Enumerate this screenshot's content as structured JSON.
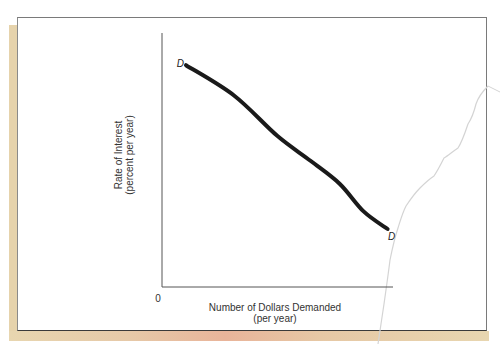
{
  "chart_data": {
    "type": "line",
    "title": "",
    "xlabel": "Number of Dollars Demanded",
    "xlabel_sub": "(per year)",
    "ylabel": "Rate of Interest",
    "ylabel_sub": "(percent per year)",
    "origin_label": "0",
    "x_ticks": [],
    "y_ticks": [],
    "xlim": [
      0,
      100
    ],
    "ylim": [
      0,
      100
    ],
    "grid": false,
    "legend": "none",
    "series": [
      {
        "name": "D",
        "start_label": "D",
        "end_label": "D",
        "color": "#1a1a1a",
        "points": [
          {
            "x": 10,
            "y": 88
          },
          {
            "x": 30,
            "y": 76
          },
          {
            "x": 48,
            "y": 60
          },
          {
            "x": 62,
            "y": 50
          },
          {
            "x": 74,
            "y": 41
          },
          {
            "x": 84,
            "y": 30
          },
          {
            "x": 94,
            "y": 23
          }
        ]
      }
    ]
  },
  "colors": {
    "page": "#ffffff",
    "shadow": "#e6d3ac",
    "accent_edge": "#e9b49a"
  }
}
